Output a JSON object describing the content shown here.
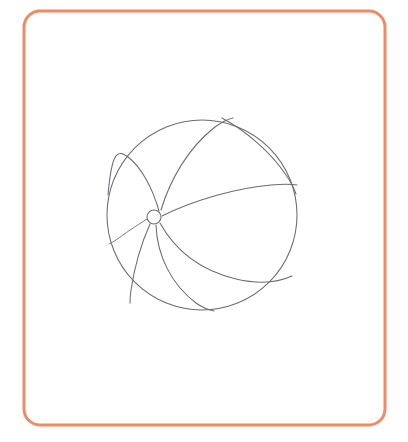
{
  "page": {
    "background_color": "#ffffff",
    "width": 408,
    "height": 442
  },
  "frame": {
    "name": "rounded-rectangle-border",
    "stroke_color": "#ef8a66",
    "stroke_width": 3,
    "corner_radius": 16,
    "x": 24,
    "y": 11,
    "width": 361,
    "height": 414,
    "fill": "none"
  },
  "artwork": {
    "subject": "beach ball",
    "style": "pencil line drawing",
    "line_color": "#6b6b72",
    "line_width": 1.05,
    "fill": "none",
    "outline": {
      "name": "ball-outline-circle",
      "cx": 202,
      "cy": 215,
      "r": 95
    },
    "hub": {
      "name": "center-hub-circle",
      "cx": 154,
      "cy": 217,
      "r": 7
    },
    "seams": [
      {
        "name": "seam-upper-left-inner",
        "description": "curve from hub up and left to top-left of rim",
        "d": "M 159 211 C 152 186 140 166 128 157 C 118 150 112 149 108 195"
      },
      {
        "name": "seam-upper-left-outer",
        "description": "long curve from hub arcing up to the top of the rim",
        "d": "M 161 210 C 170 180 188 148 215 127 C 222 122 228 119 233 118"
      },
      {
        "name": "seam-top-right-panel",
        "description": "curve from top of rim sweeping right and down to the right rim",
        "d": "M 222 118 C 248 132 272 154 286 175 C 291 182 294 188 296 194"
      },
      {
        "name": "seam-equator-right",
        "description": "curve from hub sweeping right to the right edge of the rim",
        "d": "M 162 216 C 196 199 238 188 271 185 C 283 184 291 184 297 185"
      },
      {
        "name": "seam-lower-right",
        "description": "curve from hub sweeping down-right to the lower right rim",
        "d": "M 160 223 C 176 252 203 271 236 279 C 258 284 277 283 292 276"
      },
      {
        "name": "seam-lower-middle",
        "description": "curve from hub sweeping down to the bottom of the rim",
        "d": "M 156 225 C 157 256 172 285 196 303 C 203 308 209 310 214 311"
      },
      {
        "name": "seam-lower-left",
        "description": "short curve from hub down-left to the lower-left rim",
        "d": "M 150 224 C 141 244 134 270 131 290 C 130 296 130 300 130 303"
      },
      {
        "name": "seam-left-horizon",
        "description": "short curve from hub to the left rim",
        "d": "M 147 219 C 136 226 124 234 116 240 C 113 242 111 243 109 244"
      }
    ]
  }
}
